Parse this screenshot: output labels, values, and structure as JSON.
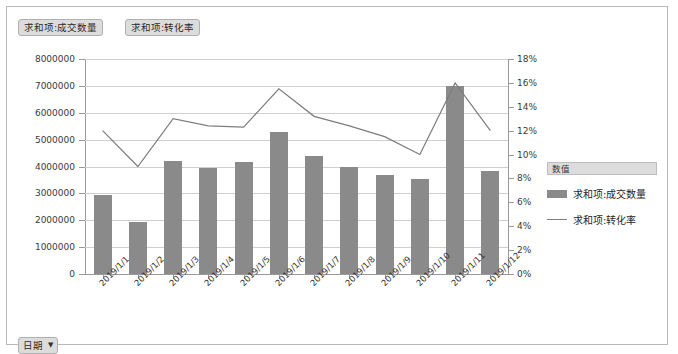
{
  "field_buttons": [
    {
      "label": "求和项:成交数量"
    },
    {
      "label": "求和项:转化率"
    }
  ],
  "filter": {
    "label": "日期",
    "caret": "▼"
  },
  "legend": {
    "title": "数值",
    "items": [
      {
        "label": "求和项:成交数量",
        "marker": "bar",
        "color": "#8a8a8a"
      },
      {
        "label": "求和项:转化率",
        "marker": "line",
        "color": "#7d7d7d"
      }
    ]
  },
  "chart_data": {
    "type": "bar",
    "title": "",
    "xlabel": "",
    "ylabel": "",
    "grid": true,
    "legend_position": "right",
    "categories": [
      "2019/1/1",
      "2019/1/2",
      "2019/1/3",
      "2019/1/4",
      "2019/1/5",
      "2019/1/6",
      "2019/1/7",
      "2019/1/8",
      "2019/1/9",
      "2019/1/10",
      "2019/1/11",
      "2019/1/12"
    ],
    "series": [
      {
        "name": "求和项:成交数量",
        "type": "bar",
        "axis": "left",
        "color": "#8a8a8a",
        "values": [
          2950000,
          1950000,
          4200000,
          3950000,
          4150000,
          5300000,
          4400000,
          4000000,
          3700000,
          3550000,
          7000000,
          3850000
        ]
      },
      {
        "name": "求和项:转化率",
        "type": "line",
        "axis": "right",
        "color": "#7d7d7d",
        "values": [
          0.12,
          0.09,
          0.13,
          0.124,
          0.123,
          0.155,
          0.132,
          0.124,
          0.115,
          0.1,
          0.16,
          0.12
        ]
      }
    ],
    "ylim": [
      0,
      8000000
    ],
    "yticks": [
      0,
      1000000,
      2000000,
      3000000,
      4000000,
      5000000,
      6000000,
      7000000,
      8000000
    ],
    "ytick_labels": [
      "0",
      "1000000",
      "2000000",
      "3000000",
      "4000000",
      "5000000",
      "6000000",
      "7000000",
      "8000000"
    ],
    "y2lim": [
      0,
      0.18
    ],
    "y2ticks": [
      0,
      0.02,
      0.04,
      0.06,
      0.08,
      0.1,
      0.12,
      0.14,
      0.16,
      0.18
    ],
    "y2tick_labels": [
      "0%",
      "2%",
      "4%",
      "6%",
      "8%",
      "10%",
      "12%",
      "14%",
      "16%",
      "18%"
    ]
  }
}
